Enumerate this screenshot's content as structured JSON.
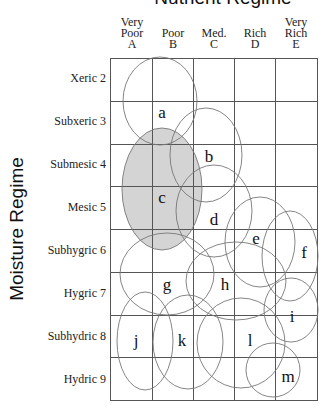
{
  "diagram": {
    "title": "Nutrient Regime",
    "y_axis_label": "Moisture Regime",
    "columns": [
      {
        "lines": [
          "Very",
          "Poor",
          "A"
        ]
      },
      {
        "lines": [
          "",
          "Poor",
          "B"
        ]
      },
      {
        "lines": [
          "",
          "Med.",
          "C"
        ]
      },
      {
        "lines": [
          "",
          "Rich",
          "D"
        ]
      },
      {
        "lines": [
          "Very",
          "Rich",
          "E"
        ]
      }
    ],
    "rows": [
      {
        "label": "Xeric 2"
      },
      {
        "label": "Subxeric 3"
      },
      {
        "label": "Submesic 4"
      },
      {
        "label": "Mesic 5"
      },
      {
        "label": "Subhygric 6"
      },
      {
        "label": "Hygric 7"
      },
      {
        "label": "Subhydric 8"
      },
      {
        "label": "Hydric 9"
      }
    ],
    "colors": {
      "grid_line": "#555555",
      "ellipse_stroke": "#777777",
      "shaded_fill": "#d4d4d4"
    },
    "units": [
      {
        "id": "a",
        "label": "a",
        "cx": 160,
        "cy": 101,
        "rx": 37,
        "ry": 44,
        "lx": 162,
        "ly": 118,
        "shaded": false
      },
      {
        "id": "b",
        "label": "b",
        "cx": 206,
        "cy": 155,
        "rx": 36,
        "ry": 47,
        "lx": 209,
        "ly": 162,
        "shaded": false
      },
      {
        "id": "c",
        "label": "c",
        "cx": 162,
        "cy": 189,
        "rx": 40,
        "ry": 61,
        "lx": 162,
        "ly": 203,
        "shaded": true
      },
      {
        "id": "d",
        "label": "d",
        "cx": 214,
        "cy": 211,
        "rx": 38,
        "ry": 46,
        "lx": 214,
        "ly": 225,
        "shaded": false
      },
      {
        "id": "e",
        "label": "e",
        "cx": 260,
        "cy": 242,
        "rx": 35,
        "ry": 45,
        "lx": 256,
        "ly": 244,
        "shaded": false
      },
      {
        "id": "f",
        "label": "f",
        "cx": 290,
        "cy": 256,
        "rx": 28,
        "ry": 45,
        "lx": 304,
        "ly": 258,
        "shaded": false
      },
      {
        "id": "g",
        "label": "g",
        "cx": 167,
        "cy": 274,
        "rx": 47,
        "ry": 41,
        "lx": 167,
        "ly": 290,
        "shaded": false
      },
      {
        "id": "h",
        "label": "h",
        "cx": 236,
        "cy": 281,
        "rx": 50,
        "ry": 39,
        "lx": 225,
        "ly": 290,
        "shaded": false
      },
      {
        "id": "i",
        "label": "i",
        "cx": 291,
        "cy": 310,
        "rx": 27,
        "ry": 32,
        "lx": 292,
        "ly": 322,
        "shaded": false
      },
      {
        "id": "j",
        "label": "j",
        "cx": 145,
        "cy": 341,
        "rx": 28,
        "ry": 49,
        "lx": 136,
        "ly": 346,
        "shaded": false
      },
      {
        "id": "k",
        "label": "k",
        "cx": 188,
        "cy": 342,
        "rx": 35,
        "ry": 47,
        "lx": 182,
        "ly": 346,
        "shaded": false
      },
      {
        "id": "l",
        "label": "l",
        "cx": 241,
        "cy": 343,
        "rx": 44,
        "ry": 45,
        "lx": 250,
        "ly": 346,
        "shaded": false
      },
      {
        "id": "m",
        "label": "m",
        "cx": 273,
        "cy": 370,
        "rx": 27,
        "ry": 27,
        "lx": 288,
        "ly": 382,
        "shaded": false
      }
    ]
  }
}
